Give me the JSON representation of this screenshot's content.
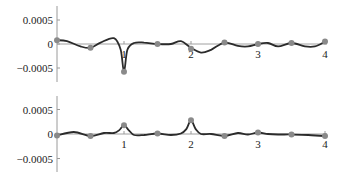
{
  "chart_data": [
    {
      "type": "line",
      "title": "",
      "xlabel": "",
      "ylabel": "",
      "xlim": [
        0,
        4
      ],
      "ylim": [
        -0.0006,
        0.0006
      ],
      "x_ticks": [
        1,
        2,
        3,
        4
      ],
      "x_tick_labels": [
        "1",
        "2",
        "3",
        "4"
      ],
      "y_ticks": [
        0.0005,
        0,
        -0.0005
      ],
      "y_tick_labels": [
        "0.0005",
        "0",
        "−0.0005"
      ],
      "grid": false,
      "legend": "none",
      "series": [
        {
          "name": "curve",
          "color": "#2b2b2b",
          "x": [
            0,
            0.15,
            0.35,
            0.5,
            0.65,
            0.85,
            0.95,
            1.0,
            1.05,
            1.15,
            1.3,
            1.5,
            1.7,
            1.85,
            2.0,
            2.15,
            2.3,
            2.5,
            2.7,
            2.85,
            3.0,
            3.15,
            3.3,
            3.5,
            3.7,
            3.85,
            4.0
          ],
          "y": [
            8e-05,
            6e-05,
            -5e-05,
            -8e-05,
            3e-05,
            0.00012,
            -0.00012,
            -0.00058,
            -0.00012,
            2e-05,
            3e-05,
            0.0,
            0.0,
            6e-05,
            -8e-05,
            -0.00018,
            -0.00012,
            3e-05,
            -4e-05,
            -5e-05,
            0.0,
            2e-05,
            -5e-05,
            2e-05,
            -5e-05,
            -5e-05,
            5e-05
          ]
        },
        {
          "name": "samples",
          "type": "scatter",
          "color": "#8a8a8a",
          "x": [
            0,
            0.5,
            1,
            1.5,
            2,
            2.5,
            3,
            3.5,
            4
          ],
          "y": [
            8e-05,
            -8e-05,
            -0.00058,
            0.0,
            -0.0001,
            3e-05,
            0.0,
            2e-05,
            5e-05
          ]
        }
      ]
    },
    {
      "type": "line",
      "title": "",
      "xlabel": "",
      "ylabel": "",
      "xlim": [
        0,
        4
      ],
      "ylim": [
        -0.0006,
        0.0006
      ],
      "x_ticks": [
        1,
        2,
        3,
        4
      ],
      "x_tick_labels": [
        "1",
        "2",
        "3",
        "4"
      ],
      "y_ticks": [
        0.0005,
        0,
        -0.0005
      ],
      "y_tick_labels": [
        "0.0005",
        "0",
        "−0.0005"
      ],
      "grid": false,
      "legend": "none",
      "series": [
        {
          "name": "curve",
          "color": "#2b2b2b",
          "x": [
            0,
            0.25,
            0.5,
            0.7,
            0.85,
            0.93,
            1.0,
            1.07,
            1.15,
            1.3,
            1.5,
            1.7,
            1.85,
            1.93,
            2.0,
            2.07,
            2.15,
            2.3,
            2.5,
            2.7,
            2.85,
            3.0,
            3.15,
            3.3,
            3.5,
            3.75,
            4.0
          ],
          "y": [
            -3e-05,
            4e-05,
            -4e-05,
            2e-05,
            2e-05,
            8e-05,
            0.00018,
            8e-05,
            -2e-05,
            -2e-05,
            1e-05,
            -2e-05,
            1e-05,
            0.0001,
            0.00028,
            0.0001,
            0.0,
            0.0,
            -4e-05,
            2e-05,
            -1e-05,
            3e-05,
            0.0,
            -1e-05,
            -1e-05,
            -2e-05,
            -4e-05
          ]
        },
        {
          "name": "samples",
          "type": "scatter",
          "color": "#8a8a8a",
          "x": [
            0,
            0.5,
            1,
            1.5,
            2,
            2.5,
            3,
            3.5,
            4
          ],
          "y": [
            -3e-05,
            -4e-05,
            0.00018,
            1e-05,
            0.00028,
            -4e-05,
            3e-05,
            -1e-05,
            -4e-05
          ]
        }
      ]
    }
  ]
}
